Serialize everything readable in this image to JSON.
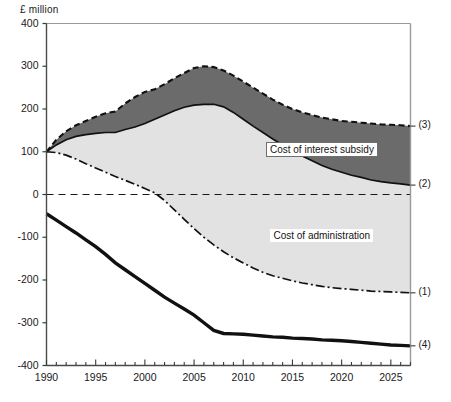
{
  "chart_data": {
    "type": "area",
    "title": "",
    "subtitle": "",
    "xlabel": "",
    "ylabel": "£ million",
    "unit_label": "£ million",
    "xlim": [
      1990,
      2027
    ],
    "ylim": [
      -400,
      400
    ],
    "grid": false,
    "zero_line": true,
    "legend_position": "inline-annotations",
    "ytick_labels": [
      "400",
      "300",
      "200",
      "100",
      "0",
      "-100",
      "-200",
      "-300",
      "-400"
    ],
    "ytick_values": [
      400,
      300,
      200,
      100,
      0,
      -100,
      -200,
      -300,
      -400
    ],
    "xtick_labels": [
      "1990",
      "1995",
      "2000",
      "2005",
      "2010",
      "2015",
      "2020",
      "2025"
    ],
    "xtick_values": [
      1990,
      1995,
      2000,
      2005,
      2010,
      2015,
      2020,
      2025
    ],
    "x_minor_tick_interval": 1,
    "annotations": [
      {
        "text": "Cost of interest subsidy",
        "boxed": true,
        "x": 2018,
        "y": 105
      },
      {
        "text": "Cost of administration",
        "boxed": false,
        "x": 2018,
        "y": -95
      }
    ],
    "series_tags": [
      "(1)",
      "(2)",
      "(3)",
      "(4)"
    ],
    "fills": [
      {
        "name": "Cost of interest subsidy",
        "between": [
          "(2)",
          "(3)"
        ],
        "color": "#6b6b6b"
      },
      {
        "name": "Cost of administration",
        "between": [
          "(1)",
          "(2)"
        ],
        "color": "#e2e2e2"
      }
    ],
    "x": [
      1990,
      1991,
      1992,
      1993,
      1994,
      1995,
      1996,
      1997,
      1998,
      1999,
      2000,
      2001,
      2002,
      2003,
      2004,
      2005,
      2006,
      2007,
      2008,
      2009,
      2010,
      2011,
      2012,
      2013,
      2014,
      2015,
      2016,
      2017,
      2018,
      2019,
      2020,
      2021,
      2022,
      2023,
      2024,
      2025,
      2026,
      2027
    ],
    "series": [
      {
        "name": "(1)",
        "tag": "(1)",
        "style": "dash-dot",
        "values": [
          100,
          98,
          92,
          83,
          72,
          62,
          52,
          42,
          33,
          24,
          14,
          4,
          -14,
          -36,
          -58,
          -80,
          -100,
          -118,
          -134,
          -148,
          -160,
          -172,
          -182,
          -190,
          -196,
          -202,
          -207,
          -211,
          -215,
          -218,
          -220,
          -222,
          -224,
          -226,
          -227,
          -228,
          -229,
          -230
        ]
      },
      {
        "name": "(2)",
        "tag": "(2)",
        "style": "solid-thin",
        "values": [
          100,
          116,
          128,
          136,
          140,
          143,
          145,
          145,
          152,
          158,
          166,
          176,
          186,
          196,
          204,
          209,
          211,
          211,
          205,
          192,
          176,
          160,
          145,
          130,
          116,
          102,
          90,
          79,
          68,
          59,
          52,
          45,
          40,
          34,
          30,
          27,
          25,
          22
        ]
      },
      {
        "name": "(3)",
        "tag": "(3)",
        "style": "dashed",
        "values": [
          100,
          128,
          148,
          162,
          172,
          182,
          190,
          194,
          213,
          228,
          240,
          246,
          258,
          272,
          284,
          296,
          300,
          298,
          290,
          278,
          264,
          250,
          236,
          222,
          210,
          200,
          192,
          186,
          180,
          176,
          172,
          170,
          168,
          166,
          164,
          163,
          162,
          160
        ]
      },
      {
        "name": "(4)",
        "tag": "(4)",
        "style": "solid-thick",
        "values": [
          -45,
          -60,
          -75,
          -90,
          -106,
          -122,
          -140,
          -160,
          -176,
          -192,
          -208,
          -224,
          -240,
          -254,
          -268,
          -282,
          -300,
          -318,
          -325,
          -326,
          -327,
          -329,
          -331,
          -333,
          -334,
          -336,
          -337,
          -338,
          -340,
          -341,
          -342,
          -344,
          -346,
          -348,
          -350,
          -352,
          -353,
          -354
        ]
      }
    ]
  }
}
